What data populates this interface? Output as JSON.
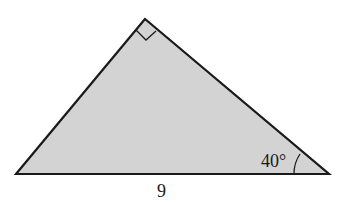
{
  "figure": {
    "type": "right-triangle",
    "fill_color": "#d3d3d3",
    "stroke_color": "#1a1a1a",
    "vertices": {
      "apex": [
        145,
        19
      ],
      "bottom_left": [
        16,
        174
      ],
      "bottom_right": [
        329,
        174
      ]
    },
    "right_angle_at": "apex",
    "labels": {
      "angle": "40°",
      "base": "9"
    }
  }
}
